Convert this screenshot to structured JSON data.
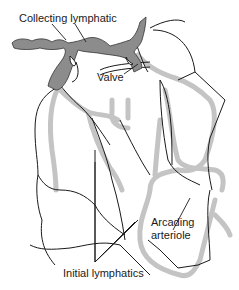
{
  "diagram": {
    "labels": {
      "collecting_lymphatic": "Collecting lymphatic",
      "valve": "Valve",
      "arcading_arteriole_line1": "Arcading",
      "arcading_arteriole_line2": "arteriole",
      "initial_lymphatics": "Initial lymphatics"
    },
    "colors": {
      "collecting_lymphatic_fill": "#8c8c8c",
      "arteriole_fill": "#c4c4c4",
      "initial_lymphatic_line": "#1a1a1a",
      "background": "#ffffff"
    }
  }
}
